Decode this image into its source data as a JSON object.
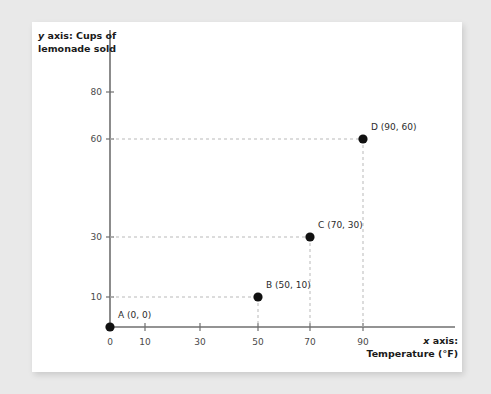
{
  "chart_data": {
    "type": "scatter",
    "title": "",
    "xlabel": "x axis: Temperature (°F)",
    "ylabel": "y axis: Cups of lemonade sold",
    "xlabel_prefix": "x",
    "xlabel_rest": " axis:",
    "xlabel_line2": "Temperature (°F)",
    "ylabel_prefix": "y",
    "ylabel_rest": " axis: Cups of",
    "ylabel_line2": "lemonade sold",
    "xticks": [
      0,
      10,
      30,
      50,
      70,
      90
    ],
    "xtick_labels": [
      "0",
      "10",
      "30",
      "50",
      "70",
      "90"
    ],
    "yticks": [
      10,
      30,
      60,
      80
    ],
    "ytick_labels": [
      "10",
      "30",
      "60",
      "80"
    ],
    "grid": false,
    "legend": "none",
    "points": [
      {
        "name": "A",
        "x": 0,
        "y": 0,
        "label": "A (0, 0)"
      },
      {
        "name": "B",
        "x": 50,
        "y": 10,
        "label": "B (50, 10)"
      },
      {
        "name": "C",
        "x": 70,
        "y": 30,
        "label": "C (70, 30)"
      },
      {
        "name": "D",
        "x": 90,
        "y": 60,
        "label": "D (90, 60)"
      }
    ],
    "marker_color": "#111111",
    "axis_color": "#6f6f6f",
    "guide_color": "#b9b9b9"
  }
}
